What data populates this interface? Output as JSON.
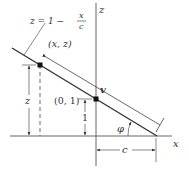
{
  "diagram": {
    "axes": {
      "x_label": "x",
      "z_label": "z"
    },
    "equation": {
      "lhs": "z = 1 −",
      "frac_num": "x",
      "frac_den": "c"
    },
    "points": {
      "general": "(x, z)",
      "intercept": "(0, 1)"
    },
    "dimensions": {
      "z_height": "z",
      "unit_height": "1",
      "x_intercept": "c"
    },
    "vector_label": "v",
    "angle_label": "φ",
    "colors": {
      "line": "#333333",
      "background": "#ffffff"
    }
  }
}
